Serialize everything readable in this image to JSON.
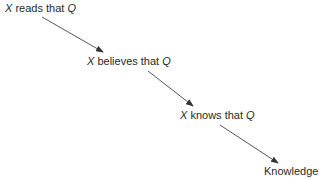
{
  "diagram": {
    "type": "chain",
    "colors": {
      "text": "#2a2a2a",
      "arrow": "#333333",
      "background": "#ffffff"
    },
    "nodes": [
      {
        "id": "reads",
        "var1": "X",
        "text": " reads that ",
        "var2": "Q"
      },
      {
        "id": "believes",
        "var1": "X",
        "text": " believes that ",
        "var2": "Q"
      },
      {
        "id": "knows",
        "var1": "X",
        "text": " knows that ",
        "var2": "Q"
      },
      {
        "id": "knowledge",
        "label": "Knowledge"
      }
    ],
    "edges": [
      {
        "from": "reads",
        "to": "believes"
      },
      {
        "from": "believes",
        "to": "knows"
      },
      {
        "from": "knows",
        "to": "knowledge"
      }
    ]
  }
}
